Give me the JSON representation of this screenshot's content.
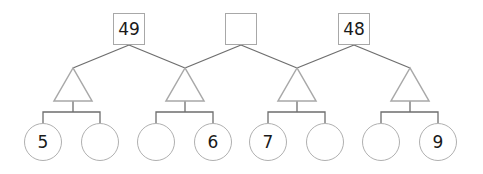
{
  "puzzle": {
    "top_boxes": [
      {
        "value": "49"
      },
      {
        "value": ""
      },
      {
        "value": "48"
      }
    ],
    "triangles": [
      {
        "value": ""
      },
      {
        "value": ""
      },
      {
        "value": ""
      },
      {
        "value": ""
      }
    ],
    "circles": [
      {
        "value": "5"
      },
      {
        "value": ""
      },
      {
        "value": ""
      },
      {
        "value": "6"
      },
      {
        "value": "7"
      },
      {
        "value": ""
      },
      {
        "value": ""
      },
      {
        "value": "9"
      }
    ]
  },
  "colors": {
    "line": "#6e6e6e",
    "shape_border": "#a8a8a8",
    "text": "#1a1a1a"
  }
}
